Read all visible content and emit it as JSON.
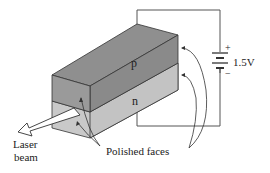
{
  "diagram": {
    "labels": {
      "p_region": "p",
      "n_region": "n",
      "plus": "+",
      "minus": "−",
      "voltage": "1.5V",
      "laser_line1": "Laser",
      "laser_line2": "beam",
      "polished": "Polished faces"
    },
    "colors": {
      "p_top": "#8f8f8f",
      "p_front": "#9a9a9a",
      "p_side": "#8a8a8a",
      "n_front": "#c9c9c9",
      "n_side": "#c3c3c3",
      "line": "#333333",
      "wire": "#555555"
    }
  }
}
